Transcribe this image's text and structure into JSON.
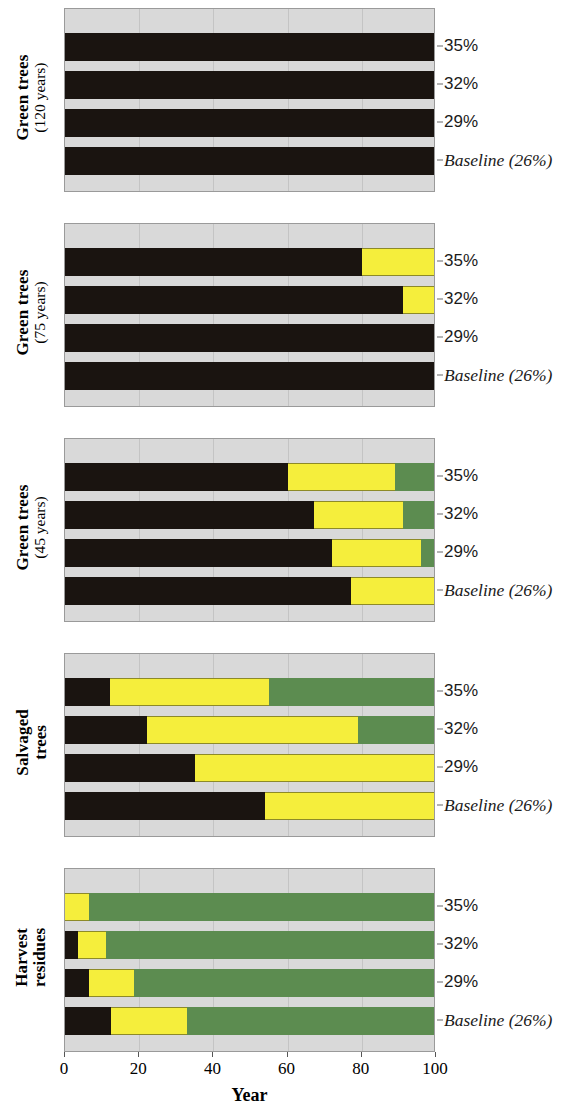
{
  "chart_data": {
    "type": "bar",
    "title": "",
    "xlabel": "Year",
    "ylabel": "",
    "xlim": [
      0,
      100
    ],
    "xticks": [
      0,
      20,
      40,
      60,
      80,
      100
    ],
    "xticklabels": [
      "0",
      "20",
      "40",
      "60",
      "80",
      "100"
    ],
    "grid": true,
    "orientation": "horizontal",
    "stacked": true,
    "legend_position": "none",
    "segment_names": [
      "black",
      "yellow",
      "green"
    ],
    "segment_colors": {
      "black": "#1a1410",
      "yellow": "#f5ee3c",
      "green": "#5c8c50",
      "plot_background": "#d9d9d9",
      "gridline": "#c4c4c4"
    },
    "series_labels": [
      "35%",
      "32%",
      "29%",
      "Baseline (26%)"
    ],
    "panels": [
      {
        "label_line1": "Green trees",
        "label_line2": "(120 years)",
        "label_line2_bold": false,
        "rows": [
          {
            "label": "35%",
            "segments": [
              100,
              0,
              0
            ]
          },
          {
            "label": "32%",
            "segments": [
              100,
              0,
              0
            ]
          },
          {
            "label": "29%",
            "segments": [
              100,
              0,
              0
            ]
          },
          {
            "label": "Baseline (26%)",
            "segments": [
              100,
              0,
              0
            ]
          }
        ]
      },
      {
        "label_line1": "Green trees",
        "label_line2": "(75 years)",
        "label_line2_bold": false,
        "rows": [
          {
            "label": "35%",
            "segments": [
              80,
              20,
              0
            ]
          },
          {
            "label": "32%",
            "segments": [
              91,
              9,
              0
            ]
          },
          {
            "label": "29%",
            "segments": [
              100,
              0,
              0
            ]
          },
          {
            "label": "Baseline (26%)",
            "segments": [
              100,
              0,
              0
            ]
          }
        ]
      },
      {
        "label_line1": "Green trees",
        "label_line2": "(45 years)",
        "label_line2_bold": false,
        "rows": [
          {
            "label": "35%",
            "segments": [
              60,
              29,
              11
            ]
          },
          {
            "label": "32%",
            "segments": [
              67,
              24,
              9
            ]
          },
          {
            "label": "29%",
            "segments": [
              72,
              24,
              4
            ]
          },
          {
            "label": "Baseline (26%)",
            "segments": [
              77,
              23,
              0
            ]
          }
        ]
      },
      {
        "label_line1": "Salvaged",
        "label_line2": "trees",
        "label_line2_bold": true,
        "rows": [
          {
            "label": "35%",
            "segments": [
              12,
              43,
              45
            ]
          },
          {
            "label": "32%",
            "segments": [
              22,
              57,
              21
            ]
          },
          {
            "label": "29%",
            "segments": [
              35,
              65,
              0
            ]
          },
          {
            "label": "Baseline (26%)",
            "segments": [
              54,
              46,
              0
            ]
          }
        ]
      },
      {
        "label_line1": "Harvest",
        "label_line2": "residues",
        "label_line2_bold": true,
        "rows": [
          {
            "label": "35%",
            "segments": [
              0,
              6.5,
              93.5
            ]
          },
          {
            "label": "32%",
            "segments": [
              3.5,
              7.5,
              89
            ]
          },
          {
            "label": "29%",
            "segments": [
              6.5,
              12,
              81.5
            ]
          },
          {
            "label": "Baseline (26%)",
            "segments": [
              12.5,
              20.5,
              67
            ]
          }
        ]
      }
    ]
  }
}
